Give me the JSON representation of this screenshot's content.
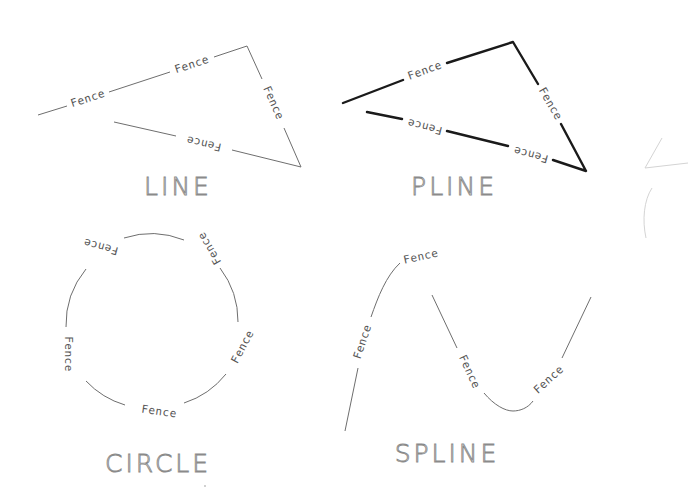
{
  "drawing": {
    "linetype_label": "Fence",
    "panels": [
      {
        "id": "line",
        "title": "LINE",
        "object_type": "LINE",
        "labels": [
          "Fence",
          "Fence",
          "Fence",
          "Fence"
        ]
      },
      {
        "id": "pline",
        "title": "PLINE",
        "object_type": "PLINE",
        "labels": [
          "Fence",
          "Fence",
          "Fence",
          "Fence"
        ]
      },
      {
        "id": "circle",
        "title": "CIRCLE",
        "object_type": "CIRCLE",
        "labels": [
          "Fence",
          "Fence",
          "Fence",
          "Fence",
          "Fence"
        ]
      },
      {
        "id": "spline",
        "title": "SPLINE",
        "object_type": "SPLINE",
        "labels": [
          "Fence",
          "Fence",
          "Fence",
          "Fence"
        ]
      }
    ],
    "colors": {
      "background": "#ffffff",
      "thin_line": "#6e6e6e",
      "thick_line": "#1a1a1a",
      "label_text": "#555555",
      "title_text": "#8a8a8a"
    }
  }
}
